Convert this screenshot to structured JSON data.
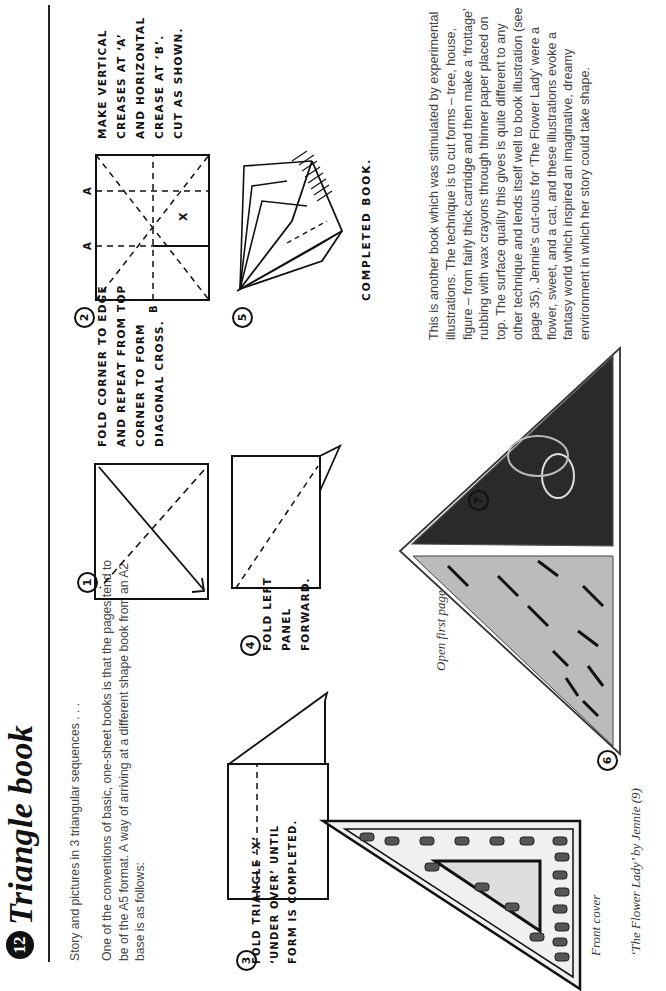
{
  "page": {
    "number": "12",
    "title": "Triangle book",
    "intro": "Story and pictures in 3 triangular sequences . . .",
    "paragraph": "One of the conventions of basic, one-sheet books is that the pages tend to be of the A5 format. A way of arriving at a different shape book from an A2 base is as follows:",
    "description": "This is another book which was stimulated by experimental illustrations. The technique is to cut forms – tree, house, figure – from fairly thick cartridge and then make a ‘frottage’ rubbing with wax crayons through thinner paper placed on top. The surface quality this gives is quite different to any other technique and lends itself well to book illustration (see page 35). Jennie’s cut-outs for ‘The Flower Lady’ were a flower, sweet, and a cat, and these illustrations evoke a fantasy world which inspired an imaginative, dreamy environment in which her story could take shape."
  },
  "steps": [
    {
      "num": "1",
      "instruction": "Fold corner to edge and repeat from top corner to form diagonal cross."
    },
    {
      "num": "2",
      "instruction": "Make vertical creases at ‘A’ and horizontal crease at ‘B’. Cut as shown.",
      "labels": {
        "a": "A",
        "b": "B",
        "x": "X"
      }
    },
    {
      "num": "3",
      "instruction": "Fold triangle ‘X’ ‘under over’ until form is completed."
    },
    {
      "num": "4",
      "instruction": "Fold left panel forward."
    },
    {
      "num": "5",
      "instruction": "Completed book."
    },
    {
      "num": "6"
    },
    {
      "num": "7"
    }
  ],
  "captions": {
    "front_cover": "Front cover",
    "open_first_page": "Open first page",
    "credit": "‘The Flower Lady’ by Jennie (9)"
  },
  "handwriting": {
    "line1": "Once there was",
    "line2": "a flower person",
    "line3": "and she loved sweets!",
    "line4": "but she could never get any"
  }
}
